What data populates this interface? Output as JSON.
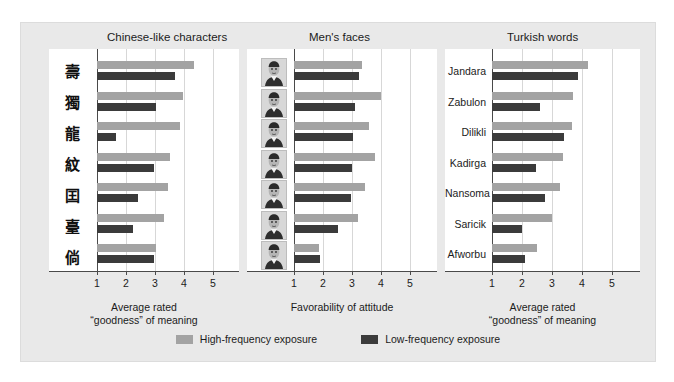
{
  "figure": {
    "background_color": "#e9e9e9",
    "plot_background_color": "#ffffff",
    "high_color": "#a3a3a3",
    "low_color": "#3b3b3b"
  },
  "legend": {
    "items": [
      {
        "label": "High-frequency exposure",
        "color": "#a3a3a3",
        "key": "high"
      },
      {
        "label": "Low-frequency exposure",
        "color": "#3b3b3b",
        "key": "low"
      }
    ]
  },
  "chart_data": [
    {
      "type": "bar",
      "title": "Chinese-like characters",
      "orientation": "horizontal",
      "xlabel": "Average rated\n“goodness” of meaning",
      "xlabel_line1": "Average rated",
      "xlabel_line2": "“goodness” of meaning",
      "ylabel": "",
      "xlim": [
        1,
        5
      ],
      "ticks": [
        1,
        2,
        3,
        4,
        5
      ],
      "grid": true,
      "categories": [
        "char-1",
        "char-2",
        "char-3",
        "char-4",
        "char-5",
        "char-6",
        "char-7"
      ],
      "category_glyphs": [
        "壽",
        "獨",
        "龍",
        "紋",
        "囯",
        "臺",
        "倘"
      ],
      "series": [
        {
          "name": "High-frequency exposure",
          "values": [
            4.35,
            3.95,
            3.85,
            3.5,
            3.45,
            3.3,
            3.05
          ]
        },
        {
          "name": "Low-frequency exposure",
          "values": [
            3.7,
            3.05,
            1.65,
            2.95,
            2.4,
            2.25,
            2.95
          ]
        }
      ]
    },
    {
      "type": "bar",
      "title": "Men's faces",
      "orientation": "horizontal",
      "xlabel": "Favorability of attitude",
      "xlabel_line1": "Favorability of attitude",
      "xlabel_line2": "",
      "ylabel": "",
      "xlim": [
        1,
        5
      ],
      "ticks": [
        1,
        2,
        3,
        4,
        5
      ],
      "grid": true,
      "categories": [
        "face-1",
        "face-2",
        "face-3",
        "face-4",
        "face-5",
        "face-6",
        "face-7"
      ],
      "series": [
        {
          "name": "High-frequency exposure",
          "values": [
            3.35,
            4.0,
            3.6,
            3.8,
            3.45,
            3.2,
            1.85
          ]
        },
        {
          "name": "Low-frequency exposure",
          "values": [
            3.25,
            3.1,
            3.05,
            3.0,
            2.95,
            2.5,
            1.9
          ]
        }
      ]
    },
    {
      "type": "bar",
      "title": "Turkish words",
      "orientation": "horizontal",
      "xlabel": "Average rated\n“goodness” of meaning",
      "xlabel_line1": "Average rated",
      "xlabel_line2": "“goodness” of meaning",
      "ylabel": "",
      "xlim": [
        1,
        5
      ],
      "ticks": [
        1,
        2,
        3,
        4,
        5
      ],
      "grid": true,
      "categories": [
        "Jandara",
        "Zabulon",
        "Dilikli",
        "Kadirga",
        "Nansoma",
        "Saricik",
        "Afworbu"
      ],
      "series": [
        {
          "name": "High-frequency exposure",
          "values": [
            4.2,
            3.7,
            3.65,
            3.35,
            3.25,
            3.0,
            2.5
          ]
        },
        {
          "name": "Low-frequency exposure",
          "values": [
            3.85,
            2.6,
            3.4,
            2.45,
            2.75,
            2.0,
            2.1
          ]
        }
      ]
    }
  ]
}
